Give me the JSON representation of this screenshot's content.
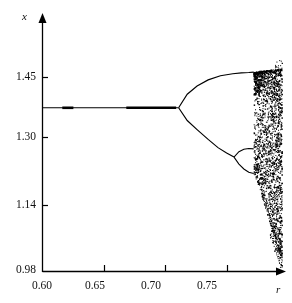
{
  "chart_data": {
    "type": "scatter",
    "title": "",
    "subtitle": "",
    "xlabel": "r",
    "ylabel": "x",
    "xlim": [
      0.6,
      0.795
    ],
    "ylim": [
      0.98,
      1.5
    ],
    "xticks": [
      0.6,
      0.65,
      0.7,
      0.75
    ],
    "xticklabels": [
      "0.60",
      "0.65",
      "0.70",
      "0.75"
    ],
    "yticks": [
      0.98,
      1.14,
      1.3,
      1.45
    ],
    "yticklabels": [
      "0.98",
      "1.14",
      "1.30",
      "1.45"
    ],
    "grid": false,
    "legend": null,
    "axis_style": "arrow-ended-spines",
    "point_color": "#000000",
    "line_color": "#000000",
    "background": "#ffffff",
    "annotations": [
      {
        "text": "first period-doubling bifurcation",
        "r": 0.711,
        "x": 1.375
      },
      {
        "text": "second period-doubling of lower branch",
        "r": 0.756,
        "x": 1.255
      },
      {
        "text": "onset of chaos",
        "r": 0.772,
        "x": 1.43
      }
    ],
    "features": {
      "fixed_point_value": 1.375,
      "fixed_point_r_range": [
        0.6,
        0.711
      ],
      "first_bifurcation_r": 0.711,
      "upper_branch_r_range": [
        0.711,
        0.772
      ],
      "upper_branch_end_value": 1.462,
      "lower_branch_r_range": [
        0.711,
        0.756
      ],
      "lower_branch_end_value": 1.255,
      "second_bifurcation_r": 0.756,
      "bubble_upper_end_value": 1.275,
      "bubble_lower_end_value": 1.215,
      "chaos_onset_r": 0.772,
      "chaos_upper_bound": 1.468,
      "chaos_lower_bound_at_right": 1.02,
      "right_edge_r": 0.795
    },
    "series": [
      {
        "name": "stable fixed point",
        "type": "line",
        "x": [
          0.6,
          0.62,
          0.64,
          0.66,
          0.68,
          0.7,
          0.711
        ],
        "values": [
          1.375,
          1.375,
          1.375,
          1.375,
          1.375,
          1.375,
          1.375
        ]
      },
      {
        "name": "period-2 upper branch",
        "type": "line",
        "x": [
          0.711,
          0.718,
          0.726,
          0.735,
          0.745,
          0.755,
          0.762,
          0.768,
          0.772
        ],
        "values": [
          1.375,
          1.408,
          1.428,
          1.443,
          1.453,
          1.458,
          1.46,
          1.461,
          1.462
        ]
      },
      {
        "name": "period-2 lower branch",
        "type": "line",
        "x": [
          0.711,
          0.718,
          0.726,
          0.735,
          0.743,
          0.75,
          0.756
        ],
        "values": [
          1.375,
          1.344,
          1.322,
          1.298,
          1.278,
          1.265,
          1.255
        ]
      },
      {
        "name": "period-4 bubble upper",
        "type": "line",
        "x": [
          0.756,
          0.76,
          0.764,
          0.768,
          0.772
        ],
        "values": [
          1.255,
          1.268,
          1.274,
          1.276,
          1.275
        ]
      },
      {
        "name": "period-4 bubble lower",
        "type": "line",
        "x": [
          0.756,
          0.76,
          0.764,
          0.768,
          0.772
        ],
        "values": [
          1.255,
          1.238,
          1.226,
          1.218,
          1.215
        ]
      },
      {
        "name": "chaotic band upper envelope",
        "type": "envelope",
        "x": [
          0.772,
          0.778,
          0.784,
          0.79,
          0.795
        ],
        "values": [
          1.462,
          1.465,
          1.467,
          1.468,
          1.47
        ]
      },
      {
        "name": "chaotic band lower envelope",
        "type": "envelope",
        "x": [
          0.772,
          0.776,
          0.78,
          0.784,
          0.788,
          0.792,
          0.795
        ],
        "values": [
          1.215,
          1.185,
          1.145,
          1.105,
          1.065,
          1.03,
          1.005
        ]
      }
    ]
  },
  "axes": {
    "y_label": "x",
    "x_label": "r",
    "y_tick_labels": [
      "1.45",
      "1.30",
      "1.14",
      "0.98"
    ],
    "x_tick_labels": [
      "0.60",
      "0.65",
      "0.70",
      "0.75"
    ]
  }
}
